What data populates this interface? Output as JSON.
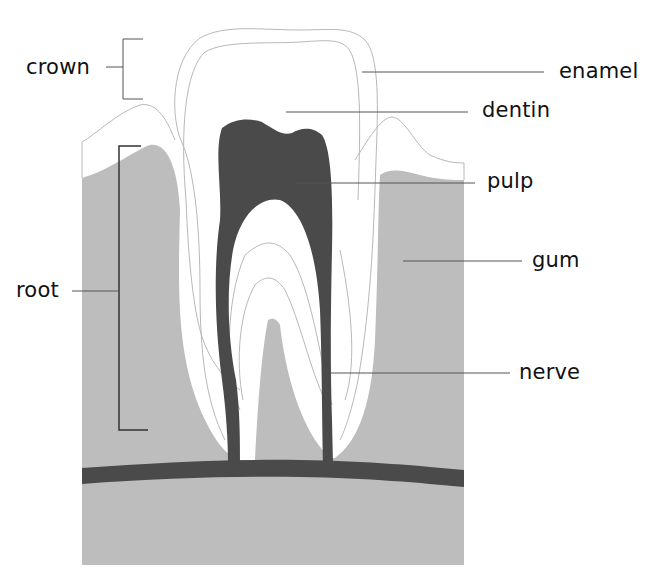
{
  "colors": {
    "background": "#ffffff",
    "gum": "#bdbdbd",
    "pulp": "#4a4a4a",
    "nerve": "#4a4a4a",
    "outline": "#b8b8b8",
    "leader": "#555555",
    "bracket": "#333333",
    "text": "#111111"
  },
  "labels": {
    "crown": "crown",
    "enamel": "enamel",
    "dentin": "dentin",
    "pulp": "pulp",
    "gum": "gum",
    "root": "root",
    "nerve": "nerve"
  }
}
